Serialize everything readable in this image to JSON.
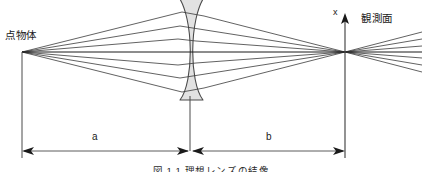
{
  "figure": {
    "caption": "図 1.1   理想レンズの結像",
    "labels": {
      "point_object": "点物体",
      "observation_plane": "観測面",
      "axis_x": "x",
      "distance_a": "a",
      "distance_b": "b"
    },
    "colors": {
      "background": "#ffffff",
      "ray": "#3a3a3a",
      "axis": "#1a1a1a",
      "lens_fill": "#e2e2e2",
      "lens_stroke": "#4a4a4a",
      "dimension_line": "#4a4a4a",
      "text": "#1a1a1a"
    },
    "geometry": {
      "object_point_x": 22,
      "object_point_y": 52,
      "lens_center_x": 190,
      "optical_axis_y": 52,
      "image_point_x": 345,
      "image_point_y": 52,
      "dimension_line_y": 151,
      "ray_count": 7
    }
  }
}
